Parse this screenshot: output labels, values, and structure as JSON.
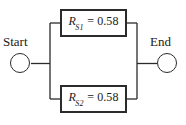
{
  "diagram": {
    "type": "reliability-block-diagram",
    "orientation": "horizontal",
    "background_color": "#ffffff",
    "line_color": "#2b2b2b",
    "text_color": "#1a1a1a",
    "start": {
      "label": "Start",
      "shape": "circle"
    },
    "end": {
      "label": "End",
      "shape": "circle"
    },
    "blocks": [
      {
        "id": "rs1",
        "symbol": "R",
        "subscript": "S1",
        "operator": "=",
        "value": "0.58",
        "full_text": "R_S1 = 0.58",
        "branch": "top"
      },
      {
        "id": "rs2",
        "symbol": "R",
        "subscript": "S2",
        "operator": "=",
        "value": "0.58",
        "full_text": "R_S2 = 0.58",
        "branch": "bottom"
      }
    ]
  }
}
